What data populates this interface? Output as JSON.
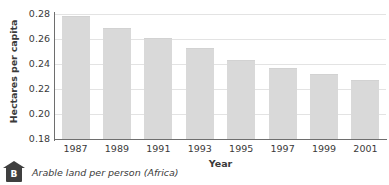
{
  "chart_data": {
    "type": "bar",
    "title": "",
    "subtitle": "",
    "xlabel": "Year",
    "ylabel": "Hectares per capita",
    "categories": [
      "1987",
      "1989",
      "1991",
      "1993",
      "1995",
      "1997",
      "1999",
      "2001"
    ],
    "values": [
      0.2775,
      0.2678,
      0.26,
      0.2518,
      0.2428,
      0.236,
      0.231,
      0.2268
    ],
    "ylim": [
      0.18,
      0.28
    ],
    "yticks": [
      "0.28",
      "0.26",
      "0.24",
      "0.22",
      "0.20",
      "0.18"
    ],
    "ytick_values": [
      0.28,
      0.26,
      0.24,
      0.22,
      0.2,
      0.18
    ],
    "grid": true,
    "legend": "none",
    "bar_color": "#d9d9d9",
    "axis_color": "#6e6e6e",
    "grid_color": "#e3e3e3",
    "text_color": "#3a3a3a"
  },
  "caption": {
    "badge_label": "B",
    "text": "Arable land per person (Africa)",
    "badge_color": "#3f3f3f"
  }
}
